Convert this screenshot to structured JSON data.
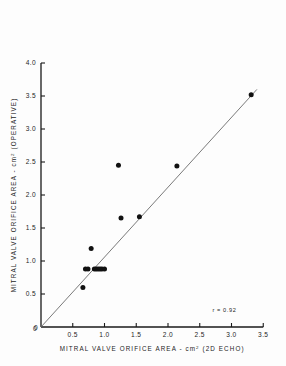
{
  "chart_data": {
    "type": "scatter",
    "title": "",
    "xlabel": "MITRAL VALVE ORIFICE AREA - cm²  (2D ECHO)",
    "ylabel": "MITRAL VALVE ORIFICE AREA - cm²  (OPERATIVE)",
    "xlabel_main": "MITRAL VALVE  ORIFICE  AREA -",
    "xlabel_unit": "cm",
    "xlabel_sup": "2",
    "xlabel_tail": "(2D ECHO)",
    "ylabel_main": "MITRAL VALVE  ORIFICE  AREA -",
    "ylabel_unit": "cm",
    "ylabel_sup": "2",
    "ylabel_tail": "(OPERATIVE)",
    "xlim": [
      0,
      3.5
    ],
    "ylim": [
      0,
      4.0
    ],
    "xticks": [
      0,
      0.5,
      1.0,
      1.5,
      2.0,
      2.5,
      3.0,
      3.5
    ],
    "xticklabels": [
      "0",
      "0.5",
      "1.0",
      "1.5",
      "2.0",
      "2.5",
      "3.0",
      "3.5"
    ],
    "yticks": [
      0,
      0.5,
      1.0,
      1.5,
      2.0,
      2.5,
      3.0,
      3.5,
      4.0
    ],
    "yticklabels": [
      "0",
      "0.5",
      "1.0",
      "1.5",
      "2.0",
      "2.5",
      "3.0",
      "3.5",
      "4.0"
    ],
    "grid": false,
    "legend": "none",
    "annotation": "r = 0.92",
    "correlation": 0.92,
    "marker": "filled-circle",
    "marker_color": "#111111",
    "line_color": "#6b6b6b",
    "line": {
      "description": "identity / regression line through origin",
      "x0": 0,
      "y0": 0,
      "x1": 3.4,
      "y1": 3.6
    },
    "points": [
      {
        "x": 0.66,
        "y": 0.6
      },
      {
        "x": 0.7,
        "y": 0.88
      },
      {
        "x": 0.74,
        "y": 0.88
      },
      {
        "x": 0.79,
        "y": 1.19
      },
      {
        "x": 0.84,
        "y": 0.88
      },
      {
        "x": 0.87,
        "y": 0.88
      },
      {
        "x": 0.9,
        "y": 0.88
      },
      {
        "x": 0.93,
        "y": 0.88
      },
      {
        "x": 0.96,
        "y": 0.88
      },
      {
        "x": 1.0,
        "y": 0.88
      },
      {
        "x": 1.22,
        "y": 2.45
      },
      {
        "x": 1.26,
        "y": 1.65
      },
      {
        "x": 1.55,
        "y": 1.67
      },
      {
        "x": 2.14,
        "y": 2.44
      },
      {
        "x": 3.31,
        "y": 3.52
      }
    ],
    "n_points": 15
  }
}
